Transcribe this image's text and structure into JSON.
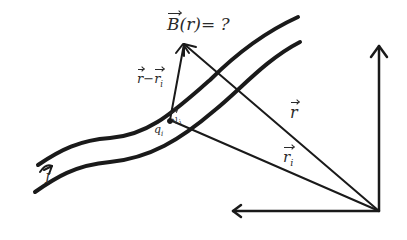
{
  "diagram": {
    "type": "physics-sketch",
    "colors": {
      "ink": "#1a1a1a",
      "background": "#ffffff"
    },
    "labels": {
      "field_question": {
        "vec": "B",
        "arg": "(r)",
        "eq": "= ?"
      },
      "separation": {
        "a": "r",
        "minus": "−",
        "b": "r",
        "b_sub": "i"
      },
      "charge": {
        "q": "q",
        "q_sub": "i"
      },
      "velocity": {
        "vec": "v",
        "sub": "i"
      },
      "field_point_vector": {
        "vec": "r"
      },
      "source_vector": {
        "vec": "r",
        "sub": "i"
      },
      "current": {
        "text": "I"
      }
    },
    "elements": [
      "wire-upper-edge",
      "wire-lower-edge",
      "current-arrow",
      "vector-r",
      "vector-r-i",
      "vector-r-minus-r-i",
      "x-axis",
      "y-axis"
    ]
  }
}
